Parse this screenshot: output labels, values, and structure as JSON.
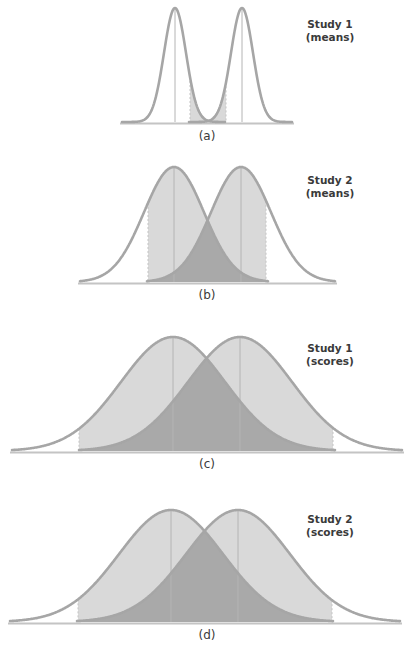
{
  "colors": {
    "curve": "#a6a6a6",
    "light_fill": "#d9d9d9",
    "overlap_fill": "#a9a9a9",
    "mean_line": "#b4b4b4",
    "baseline": "#c4c4c4",
    "text": "#3a3a3a",
    "background": "#ffffff"
  },
  "chart_data": [
    {
      "type": "area",
      "panel": "(a)",
      "title": "Study 1 (means)",
      "title_lines": [
        "Study 1",
        "(means)"
      ],
      "description": "Two narrow overlapping normal distributions of means; shaded central region between critical values with darker overlap",
      "distributions": [
        {
          "name": "left",
          "mean_px": 175,
          "sd_px": 11
        },
        {
          "name": "right",
          "mean_px": 242,
          "sd_px": 11
        }
      ],
      "shaded_range_px": [
        190,
        226
      ],
      "baseline_y": 122,
      "peak_y": 8,
      "x_range_px": [
        122,
        292
      ]
    },
    {
      "type": "area",
      "panel": "(b)",
      "title": "Study 2 (means)",
      "title_lines": [
        "Study 2",
        "(means)"
      ],
      "description": "Two wider overlapping normal distributions of means; shaded region between dashed bounds with darker overlap",
      "distributions": [
        {
          "name": "left",
          "mean_px": 174,
          "sd_px": 30
        },
        {
          "name": "right",
          "mean_px": 241,
          "sd_px": 30
        }
      ],
      "shaded_range_px": [
        148,
        266
      ],
      "baseline_y": 282,
      "peak_y": 167,
      "x_range_px": [
        80,
        335
      ]
    },
    {
      "type": "area",
      "panel": "(c)",
      "title": "Study 1 (scores)",
      "title_lines": [
        "Study 1",
        "(scores)"
      ],
      "description": "Two broad overlapping normal distributions of scores; large dark overlap",
      "distributions": [
        {
          "name": "left",
          "mean_px": 173,
          "sd_px": 52
        },
        {
          "name": "right",
          "mean_px": 240,
          "sd_px": 52
        }
      ],
      "shaded_range_px": [
        79,
        333
      ],
      "baseline_y": 451,
      "peak_y": 337,
      "x_range_px": [
        12,
        402
      ]
    },
    {
      "type": "area",
      "panel": "(d)",
      "title": "Study 2 (scores)",
      "title_lines": [
        "Study 2",
        "(scores)"
      ],
      "description": "Two broad overlapping normal distributions of scores; large dark overlap (same as c)",
      "distributions": [
        {
          "name": "left",
          "mean_px": 171,
          "sd_px": 52
        },
        {
          "name": "right",
          "mean_px": 238,
          "sd_px": 52
        }
      ],
      "shaded_range_px": [
        78,
        332
      ],
      "baseline_y": 622,
      "peak_y": 510,
      "x_range_px": [
        10,
        400
      ]
    }
  ],
  "labels": {
    "a": {
      "panel": "(a)",
      "study": "Study 1",
      "kind": "(means)"
    },
    "b": {
      "panel": "(b)",
      "study": "Study 2",
      "kind": "(means)"
    },
    "c": {
      "panel": "(c)",
      "study": "Study 1",
      "kind": "(scores)"
    },
    "d": {
      "panel": "(d)",
      "study": "Study 2",
      "kind": "(scores)"
    }
  }
}
